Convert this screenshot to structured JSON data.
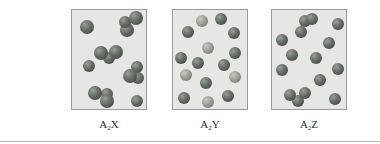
{
  "figure": {
    "panels": [
      {
        "id": "A2X",
        "label_main": "A",
        "label_sub": "2",
        "label_tail": "X",
        "box": {
          "left": 71
        },
        "spheres": [
          {
            "x": 87,
            "y": 27,
            "r": 7,
            "tone": "dark"
          },
          {
            "x": 127,
            "y": 30,
            "r": 7,
            "tone": "dark"
          },
          {
            "x": 125,
            "y": 22,
            "r": 6,
            "tone": "dark"
          },
          {
            "x": 136,
            "y": 18,
            "r": 7,
            "tone": "dark"
          },
          {
            "x": 109,
            "y": 58,
            "r": 6,
            "tone": "dark"
          },
          {
            "x": 101,
            "y": 53,
            "r": 7,
            "tone": "dark"
          },
          {
            "x": 116,
            "y": 52,
            "r": 7,
            "tone": "dark"
          },
          {
            "x": 89,
            "y": 66,
            "r": 6,
            "tone": "dark"
          },
          {
            "x": 138,
            "y": 78,
            "r": 6,
            "tone": "dark"
          },
          {
            "x": 137,
            "y": 67,
            "r": 6,
            "tone": "dark"
          },
          {
            "x": 130,
            "y": 76,
            "r": 7,
            "tone": "dark"
          },
          {
            "x": 107,
            "y": 94,
            "r": 6,
            "tone": "dark"
          },
          {
            "x": 95,
            "y": 93,
            "r": 7,
            "tone": "dark"
          },
          {
            "x": 107,
            "y": 101,
            "r": 7,
            "tone": "dark"
          },
          {
            "x": 137,
            "y": 101,
            "r": 6,
            "tone": "dark"
          }
        ]
      },
      {
        "id": "A2Y",
        "label_main": "A",
        "label_sub": "2",
        "label_tail": "Y",
        "box": {
          "left": 172
        },
        "spheres": [
          {
            "x": 202,
            "y": 21,
            "r": 6,
            "tone": "light"
          },
          {
            "x": 221,
            "y": 19,
            "r": 6,
            "tone": "dark"
          },
          {
            "x": 188,
            "y": 32,
            "r": 6,
            "tone": "dark"
          },
          {
            "x": 234,
            "y": 33,
            "r": 6,
            "tone": "dark"
          },
          {
            "x": 208,
            "y": 48,
            "r": 6,
            "tone": "light"
          },
          {
            "x": 235,
            "y": 53,
            "r": 6,
            "tone": "dark"
          },
          {
            "x": 181,
            "y": 58,
            "r": 6,
            "tone": "dark"
          },
          {
            "x": 198,
            "y": 63,
            "r": 6,
            "tone": "dark"
          },
          {
            "x": 224,
            "y": 65,
            "r": 6,
            "tone": "dark"
          },
          {
            "x": 186,
            "y": 75,
            "r": 6,
            "tone": "light"
          },
          {
            "x": 235,
            "y": 77,
            "r": 6,
            "tone": "light"
          },
          {
            "x": 206,
            "y": 83,
            "r": 6,
            "tone": "dark"
          },
          {
            "x": 184,
            "y": 98,
            "r": 6,
            "tone": "dark"
          },
          {
            "x": 208,
            "y": 102,
            "r": 6,
            "tone": "light"
          },
          {
            "x": 228,
            "y": 96,
            "r": 6,
            "tone": "dark"
          }
        ]
      },
      {
        "id": "A2Z",
        "label_main": "A",
        "label_sub": "2",
        "label_tail": "Z",
        "box": {
          "left": 271
        },
        "spheres": [
          {
            "x": 305,
            "y": 21,
            "r": 6,
            "tone": "dark"
          },
          {
            "x": 312,
            "y": 19,
            "r": 6,
            "tone": "dark"
          },
          {
            "x": 301,
            "y": 32,
            "r": 6,
            "tone": "dark"
          },
          {
            "x": 338,
            "y": 24,
            "r": 6,
            "tone": "dark"
          },
          {
            "x": 282,
            "y": 40,
            "r": 6,
            "tone": "dark"
          },
          {
            "x": 329,
            "y": 43,
            "r": 6,
            "tone": "dark"
          },
          {
            "x": 292,
            "y": 55,
            "r": 6,
            "tone": "dark"
          },
          {
            "x": 316,
            "y": 58,
            "r": 6,
            "tone": "dark"
          },
          {
            "x": 282,
            "y": 70,
            "r": 6,
            "tone": "dark"
          },
          {
            "x": 338,
            "y": 69,
            "r": 6,
            "tone": "dark"
          },
          {
            "x": 320,
            "y": 80,
            "r": 6,
            "tone": "dark"
          },
          {
            "x": 298,
            "y": 101,
            "r": 6,
            "tone": "dark"
          },
          {
            "x": 290,
            "y": 95,
            "r": 6,
            "tone": "dark"
          },
          {
            "x": 305,
            "y": 93,
            "r": 6,
            "tone": "dark"
          },
          {
            "x": 335,
            "y": 99,
            "r": 6,
            "tone": "dark"
          }
        ]
      }
    ]
  },
  "colors": {
    "box_fill": "#e6e6e4",
    "box_border": "#9a9a98",
    "sphere_dark": "#5c6259",
    "sphere_light": "#9ea49a",
    "label_text": "#2a2a2a"
  }
}
